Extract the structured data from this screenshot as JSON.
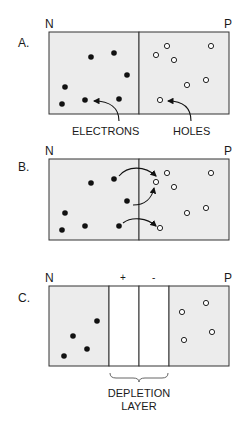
{
  "colors": {
    "region_fill": "#ececec",
    "depletion_fill": "#ffffff",
    "stroke": "#333333",
    "electron": "#111111",
    "hole_fill": "#ffffff"
  },
  "panels": [
    {
      "id": "A",
      "label": "A.",
      "n_label": "N",
      "p_label": "P",
      "electrons": [
        [
          91,
          57
        ],
        [
          114,
          53
        ],
        [
          127,
          75
        ],
        [
          65,
          87
        ],
        [
          62,
          104
        ],
        [
          85,
          100
        ],
        [
          119,
          99
        ]
      ],
      "holes": [
        [
          156,
          55
        ],
        [
          167,
          46
        ],
        [
          174,
          60
        ],
        [
          211,
          46
        ],
        [
          187,
          85
        ],
        [
          206,
          80
        ],
        [
          160,
          100
        ]
      ],
      "annotations": {
        "electrons": "ELECTRONS",
        "holes": "HOLES"
      }
    },
    {
      "id": "B",
      "label": "B.",
      "n_label": "N",
      "p_label": "P",
      "electrons": [
        [
          91,
          183
        ],
        [
          114,
          179
        ],
        [
          127,
          201
        ],
        [
          65,
          213
        ],
        [
          62,
          230
        ],
        [
          85,
          226
        ],
        [
          119,
          226
        ]
      ],
      "holes": [
        [
          167,
          173
        ],
        [
          156,
          182
        ],
        [
          174,
          187
        ],
        [
          211,
          173
        ],
        [
          187,
          213
        ],
        [
          206,
          208
        ],
        [
          160,
          228
        ]
      ]
    },
    {
      "id": "C",
      "label": "C.",
      "n_label": "N",
      "p_label": "P",
      "plus": "+",
      "minus": "-",
      "electrons": [
        [
          97,
          321
        ],
        [
          73,
          336
        ],
        [
          87,
          349
        ],
        [
          64,
          356
        ]
      ],
      "holes": [
        [
          182,
          312
        ],
        [
          206,
          303
        ],
        [
          212,
          332
        ],
        [
          184,
          340
        ]
      ],
      "caption_line1": "DEPLETION",
      "caption_line2": "LAYER"
    }
  ]
}
